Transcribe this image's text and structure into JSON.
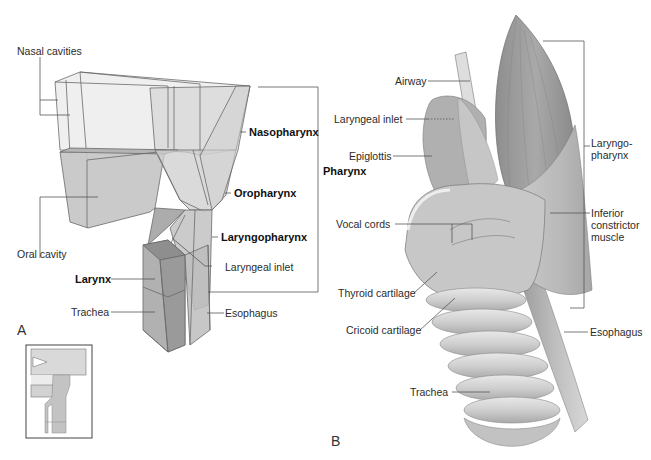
{
  "panel_a": {
    "panel_letter": "A",
    "labels": {
      "nasal_cavities": "Nasal cavities",
      "nasopharynx": "Nasopharynx",
      "oropharynx": "Oropharynx",
      "laryngopharynx": "Laryngopharynx",
      "pharynx": "Pharynx",
      "oral_cavity": "Oral cavity",
      "laryngeal_inlet": "Laryngeal inlet",
      "larynx": "Larynx",
      "trachea": "Trachea",
      "esophagus": "Esophagus"
    },
    "bold_labels": [
      "Nasopharynx",
      "Oropharynx",
      "Laryngopharynx",
      "Pharynx",
      "Larynx"
    ],
    "inset": {
      "description": "orientation thumbnail with arrow pointing right"
    }
  },
  "panel_b": {
    "panel_letter": "B",
    "labels": {
      "airway": "Airway",
      "laryngeal_inlet": "Laryngeal inlet",
      "epiglottis": "Epiglottis",
      "vocal_cords": "Vocal cords",
      "thyroid_cartilage": "Thyroid cartilage",
      "cricoid_cartilage": "Cricoid cartilage",
      "trachea": "Trachea",
      "laryngopharynx_line1": "Laryngo-",
      "laryngopharynx_line2": "pharynx",
      "inferior_constrictor_line1": "Inferior",
      "inferior_constrictor_line2": "constrictor",
      "inferior_constrictor_line3": "muscle",
      "esophagus": "Esophagus"
    }
  },
  "colors": {
    "background": "#ffffff",
    "leader_line": "#555555",
    "box_light": "#e4e4e4",
    "box_mid": "#c8c8c8",
    "box_dark": "#a8a8a8",
    "muscle": "#9a9a9a",
    "cartilage": "#d2d2d2"
  }
}
